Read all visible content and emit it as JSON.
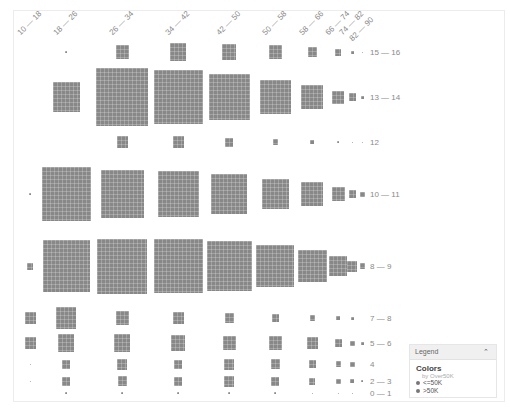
{
  "chart_data": {
    "type": "heatmap",
    "subtype": "unit-grid block chart (block area ~ count)",
    "title": "",
    "x_field": "Age bin",
    "y_field": "Education-num bin",
    "columns": [
      "10 — 18",
      "18 — 26",
      "26 — 34",
      "34 — 42",
      "42 — 50",
      "50 — 58",
      "58 — 66",
      "66 — 74",
      "74 — 82",
      "82 — 90"
    ],
    "rows": [
      "15 — 16",
      "13 — 14",
      "12",
      "10 — 11",
      "8 — 9",
      "7 — 8",
      "5 — 6",
      "4",
      "2 — 3",
      "0 — 1"
    ],
    "legend": {
      "title": "Colors",
      "subtitle": "by Over50K",
      "entries": [
        "<=50K",
        ">50K"
      ]
    },
    "grid": false,
    "block_sizes_px": [
      [
        0,
        2,
        14,
        18,
        16,
        14,
        10,
        7,
        3,
        1
      ],
      [
        0,
        30,
        58,
        54,
        46,
        34,
        24,
        13,
        8,
        3
      ],
      [
        0,
        0,
        12,
        12,
        9,
        6,
        4,
        2,
        1,
        1
      ],
      [
        2,
        54,
        48,
        46,
        40,
        30,
        24,
        14,
        8,
        5
      ],
      [
        7,
        52,
        55,
        54,
        50,
        42,
        32,
        20,
        11,
        6
      ],
      [
        12,
        22,
        14,
        12,
        10,
        8,
        6,
        4,
        3,
        0
      ],
      [
        12,
        18,
        18,
        16,
        14,
        14,
        12,
        8,
        5,
        3
      ],
      [
        1,
        9,
        11,
        9,
        11,
        10,
        8,
        6,
        5,
        0
      ],
      [
        1,
        9,
        10,
        9,
        11,
        9,
        7,
        5,
        4,
        2
      ],
      [
        0,
        2,
        2,
        2,
        2,
        2,
        1,
        1,
        1,
        0
      ]
    ]
  },
  "labels": {
    "columns": [
      "10 — 18",
      "18 — 26",
      "26 — 34",
      "34 — 42",
      "42 — 50",
      "50 — 58",
      "58 — 66",
      "66 — 74",
      "74 — 82",
      "82 — 90"
    ],
    "rows": [
      "15 — 16",
      "13 — 14",
      "12",
      "10 — 11",
      "8 — 9",
      "7 — 8",
      "5 — 6",
      "4",
      "2 — 3",
      "0 — 1"
    ]
  },
  "legend": {
    "header": "Legend",
    "collapse_icon": "chevron-up-icon",
    "title": "Colors",
    "subtitle": "by Over50K",
    "items": [
      {
        "label": "<=50K",
        "color": "#777777"
      },
      {
        "label": ">50K",
        "color": "#777777"
      }
    ]
  },
  "colors": {
    "block": "#888888",
    "label": "#8a8a8a"
  }
}
